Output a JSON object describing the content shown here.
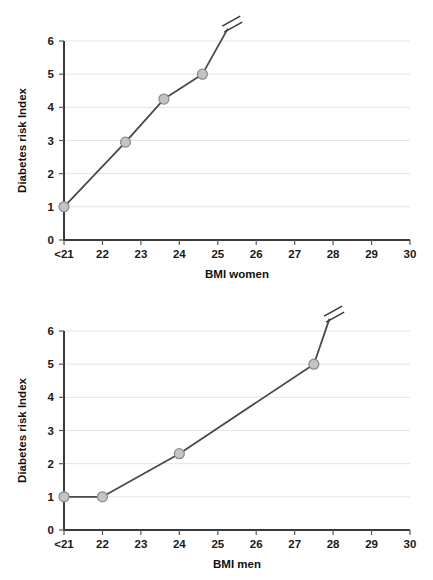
{
  "figure": {
    "background_color": "#ffffff",
    "line_color": "#4a4a4a",
    "marker_fill_color": "#c4c4c4",
    "marker_edge_color": "#8a8a8a",
    "gridline_color": "#e4e4e4",
    "axis_color": "#3a3a3a"
  },
  "chart_data": [
    {
      "type": "line",
      "id": "women",
      "title": "",
      "xlabel": "BMI women",
      "ylabel": "Diabetes risk Index",
      "x_tick_labels": [
        "<21",
        "22",
        "23",
        "24",
        "25",
        "26",
        "27",
        "28",
        "29",
        "30"
      ],
      "x_tick_values": [
        21,
        22,
        23,
        24,
        25,
        26,
        27,
        28,
        29,
        30
      ],
      "y_tick_labels": [
        "0",
        "1",
        "2",
        "3",
        "4",
        "5",
        "6"
      ],
      "y_tick_values": [
        0,
        1,
        2,
        3,
        4,
        5,
        6
      ],
      "xlim": [
        21,
        30
      ],
      "ylim": [
        0,
        6
      ],
      "grid": "horizontal",
      "legend": "none",
      "series": [
        {
          "name": "Diabetes risk Index",
          "x": [
            21.0,
            22.6,
            23.6,
            24.6
          ],
          "y": [
            1.0,
            2.95,
            4.25,
            5.0
          ]
        }
      ],
      "axis_break": {
        "label": "axis-break",
        "x": 25.35,
        "y": 6.6,
        "line_to_x": 25.25,
        "line_to_y": 6.35
      }
    },
    {
      "type": "line",
      "id": "men",
      "title": "",
      "xlabel": "BMI men",
      "ylabel": "Diabetes risk Index",
      "x_tick_labels": [
        "<21",
        "22",
        "23",
        "24",
        "25",
        "26",
        "27",
        "28",
        "29",
        "30"
      ],
      "x_tick_values": [
        21,
        22,
        23,
        24,
        25,
        26,
        27,
        28,
        29,
        30
      ],
      "y_tick_labels": [
        "0",
        "1",
        "2",
        "3",
        "4",
        "5",
        "6"
      ],
      "y_tick_values": [
        0,
        1,
        2,
        3,
        4,
        5,
        6
      ],
      "xlim": [
        21,
        30
      ],
      "ylim": [
        0,
        6
      ],
      "grid": "horizontal",
      "legend": "none",
      "series": [
        {
          "name": "Diabetes risk Index",
          "x": [
            21.0,
            22.0,
            24.0,
            27.5
          ],
          "y": [
            1.0,
            1.0,
            2.3,
            5.0
          ]
        }
      ],
      "axis_break": {
        "label": "axis-break",
        "x": 28.0,
        "y": 6.6,
        "line_to_x": 27.9,
        "line_to_y": 6.35
      }
    }
  ]
}
